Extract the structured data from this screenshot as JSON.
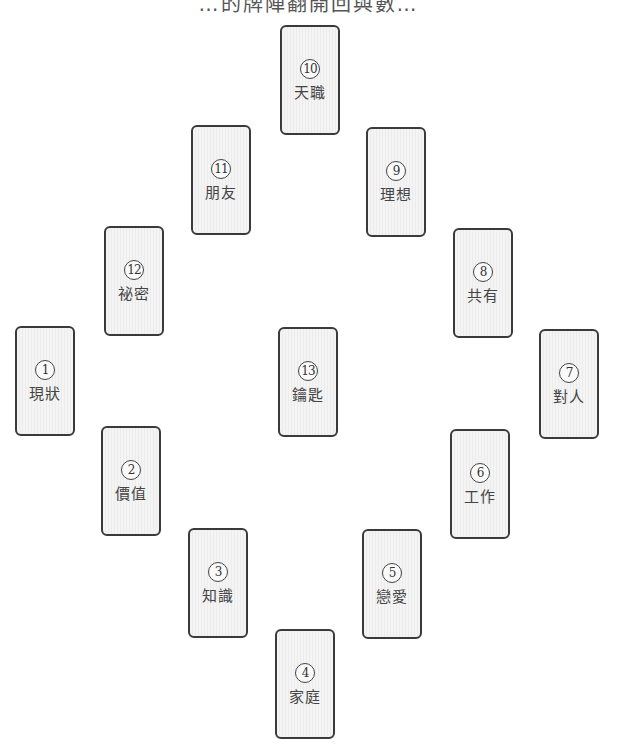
{
  "title": "…的牌陣翻開回與數…",
  "cards": [
    {
      "number": "1",
      "label": "現狀",
      "x": 15,
      "y": 326
    },
    {
      "number": "2",
      "label": "價值",
      "x": 101,
      "y": 426
    },
    {
      "number": "3",
      "label": "知識",
      "x": 188,
      "y": 528
    },
    {
      "number": "4",
      "label": "家庭",
      "x": 275,
      "y": 629
    },
    {
      "number": "5",
      "label": "戀愛",
      "x": 362,
      "y": 529
    },
    {
      "number": "6",
      "label": "工作",
      "x": 450,
      "y": 429
    },
    {
      "number": "7",
      "label": "對人",
      "x": 539,
      "y": 329
    },
    {
      "number": "8",
      "label": "共有",
      "x": 453,
      "y": 228
    },
    {
      "number": "9",
      "label": "理想",
      "x": 366,
      "y": 127
    },
    {
      "number": "10",
      "label": "天職",
      "x": 280,
      "y": 25
    },
    {
      "number": "11",
      "label": "朋友",
      "x": 191,
      "y": 125
    },
    {
      "number": "12",
      "label": "祕密",
      "x": 104,
      "y": 226
    },
    {
      "number": "13",
      "label": "鑰匙",
      "x": 278,
      "y": 327
    }
  ]
}
